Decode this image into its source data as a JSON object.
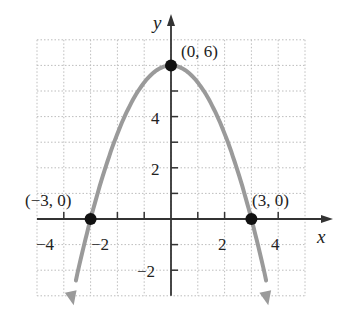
{
  "chart_data": {
    "type": "line",
    "title": "",
    "equation": "y = 6 - (2/3)x^2",
    "xlabel": "x",
    "ylabel": "y",
    "xlim": [
      -5,
      5
    ],
    "ylim": [
      -3,
      7
    ],
    "grid": true,
    "x_tick_labels": [
      "-4",
      "-2",
      "2",
      "4"
    ],
    "x_tick_values": [
      -4,
      -2,
      2,
      4
    ],
    "y_tick_labels": [
      "4",
      "2",
      "-2"
    ],
    "y_tick_values": [
      4,
      2,
      -2
    ],
    "series": [
      {
        "name": "parabola",
        "color": "#9a9a9a",
        "x": [
          -3.67,
          -3,
          -2,
          -1,
          0,
          1,
          2,
          3,
          3.67
        ],
        "y": [
          -3,
          0,
          3.33,
          5.33,
          6,
          5.33,
          3.33,
          0,
          -3
        ]
      }
    ],
    "points": [
      {
        "x": 0,
        "y": 6,
        "label": "(0, 6)"
      },
      {
        "x": -3,
        "y": 0,
        "label": "(−3, 0)"
      },
      {
        "x": 3,
        "y": 0,
        "label": "(3, 0)"
      }
    ],
    "annotations": [
      "(0, 6)",
      "(−3, 0)",
      "(3, 0)"
    ]
  },
  "labels": {
    "x_axis": "x",
    "y_axis": "y",
    "xt": [
      "−4",
      "−2",
      "2",
      "4"
    ],
    "yt": [
      "4",
      "2",
      "−2"
    ],
    "vertex": "(0, 6)",
    "left_intercept": "(−3, 0)",
    "right_intercept": "(3, 0)"
  },
  "colors": {
    "curve": "#9a9a9a",
    "axis": "#333333",
    "grid": "#bdbdbd",
    "point": "#111111"
  }
}
